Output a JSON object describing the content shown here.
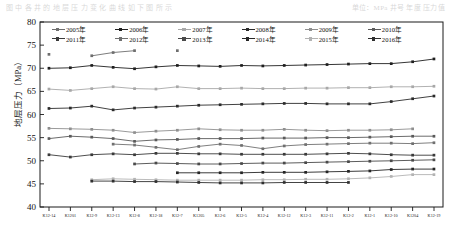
{
  "page": {
    "header_left": "图 中 各 井 的 地 层 压 力 变 化 曲 线 如 下 图 所 示",
    "header_right": "单位：MPa  井号  年度  压力值"
  },
  "chart_data": {
    "type": "line",
    "title": "",
    "xlabel": "",
    "ylabel": "地层压力（MPa）",
    "ylim": [
      40,
      80
    ],
    "ytick_step": 5,
    "yticks": [
      40,
      45,
      50,
      55,
      60,
      65,
      70,
      75,
      80
    ],
    "grid": false,
    "legend_position": "top-inside",
    "categories": [
      "K12-14",
      "K1201",
      "K12-9",
      "K12-13",
      "K12-8",
      "K12-18",
      "K12-7",
      "K1205",
      "K12-6",
      "K12-5",
      "K12-4",
      "K12-12",
      "K12-3",
      "K12-11",
      "K12-2",
      "K12-1",
      "K12-10",
      "K1204",
      "K12-19"
    ],
    "series": [
      {
        "name": "2005年",
        "color": "#6e6e6e",
        "marker": "square",
        "values": [
          73.0,
          null,
          72.7,
          73.4,
          73.8,
          null,
          73.8,
          null,
          null,
          null,
          null,
          null,
          null,
          null,
          null,
          null,
          null,
          null,
          null
        ]
      },
      {
        "name": "2006年",
        "color": "#1f1f1f",
        "marker": "square",
        "values": [
          70.0,
          70.1,
          70.6,
          70.2,
          69.9,
          70.3,
          70.6,
          70.5,
          70.4,
          70.6,
          70.5,
          70.6,
          70.7,
          70.8,
          70.9,
          71.0,
          71.0,
          71.4,
          72.0
        ]
      },
      {
        "name": "2007年",
        "color": "#a8a8a8",
        "marker": "square",
        "values": [
          65.5,
          65.2,
          65.6,
          66.0,
          65.6,
          65.5,
          66.0,
          65.6,
          65.6,
          65.7,
          65.6,
          65.6,
          65.7,
          65.7,
          65.8,
          65.8,
          66.0,
          66.0,
          66.1
        ]
      },
      {
        "name": "2008年",
        "color": "#2b2b2b",
        "marker": "square",
        "values": [
          61.3,
          61.4,
          61.8,
          61.0,
          61.4,
          61.6,
          61.8,
          62.0,
          62.1,
          62.2,
          62.3,
          62.4,
          62.4,
          62.3,
          62.3,
          62.3,
          62.8,
          63.4,
          64.0
        ]
      },
      {
        "name": "2009年",
        "color": "#8f8f8f",
        "marker": "square",
        "values": [
          57.0,
          56.9,
          56.8,
          56.6,
          56.1,
          56.4,
          56.6,
          56.9,
          56.7,
          56.6,
          56.6,
          56.8,
          56.6,
          56.5,
          56.6,
          56.6,
          56.7,
          56.9,
          null
        ]
      },
      {
        "name": "2010年",
        "color": "#5a5a5a",
        "marker": "square",
        "values": [
          54.8,
          55.3,
          55.1,
          54.8,
          54.2,
          54.5,
          54.6,
          54.8,
          54.8,
          54.8,
          54.9,
          54.9,
          54.9,
          55.0,
          55.0,
          55.1,
          55.2,
          55.3,
          55.3
        ]
      },
      {
        "name": "2011年",
        "color": "#3a3a3a",
        "marker": "square",
        "values": [
          51.3,
          50.8,
          51.3,
          51.5,
          51.3,
          51.6,
          51.6,
          51.5,
          51.5,
          51.4,
          51.4,
          51.4,
          51.4,
          51.5,
          51.6,
          51.5,
          51.3,
          51.2,
          51.2
        ]
      },
      {
        "name": "2012年",
        "color": "#707070",
        "marker": "square",
        "values": [
          null,
          null,
          null,
          53.6,
          53.4,
          52.9,
          52.4,
          53.1,
          53.6,
          53.3,
          52.6,
          53.2,
          53.5,
          53.6,
          53.7,
          53.8,
          53.8,
          53.7,
          53.9
        ]
      },
      {
        "name": "2013年",
        "color": "#4a4a4a",
        "marker": "square",
        "values": [
          null,
          null,
          null,
          null,
          49.3,
          49.5,
          49.4,
          49.3,
          49.3,
          49.4,
          49.5,
          49.5,
          49.6,
          49.7,
          49.8,
          49.9,
          50.0,
          50.1,
          50.2
        ]
      },
      {
        "name": "2014年",
        "color": "#262626",
        "marker": "square",
        "values": [
          null,
          null,
          null,
          null,
          null,
          null,
          47.4,
          47.4,
          47.4,
          47.4,
          47.5,
          47.5,
          47.5,
          47.6,
          47.7,
          47.8,
          48.1,
          48.2,
          48.2
        ]
      },
      {
        "name": "2015年",
        "color": "#b3b3b3",
        "marker": "square",
        "values": [
          null,
          null,
          45.9,
          46.1,
          46.0,
          45.9,
          45.8,
          45.8,
          45.8,
          45.8,
          45.9,
          45.9,
          46.0,
          46.0,
          46.1,
          46.3,
          46.6,
          47.0,
          47.0
        ]
      },
      {
        "name": "2016年",
        "color": "#2f2f2f",
        "marker": "square",
        "values": [
          null,
          null,
          45.6,
          45.6,
          45.5,
          45.5,
          45.4,
          45.3,
          45.2,
          45.2,
          45.2,
          45.3,
          45.3,
          45.3,
          45.3,
          null,
          null,
          null,
          null
        ]
      }
    ]
  }
}
